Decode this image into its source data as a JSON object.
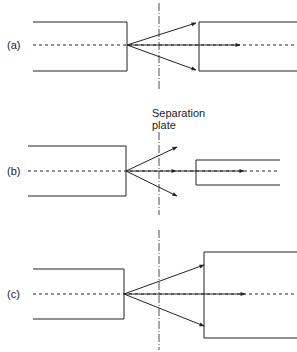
{
  "diagram": {
    "panels": [
      {
        "label": "(a)"
      },
      {
        "label": "(b)"
      },
      {
        "label": "(c)"
      }
    ],
    "annotation": {
      "line1": "Separation",
      "line2": "plate"
    },
    "colors": {
      "line": "#222222",
      "background": "#ffffff"
    }
  }
}
